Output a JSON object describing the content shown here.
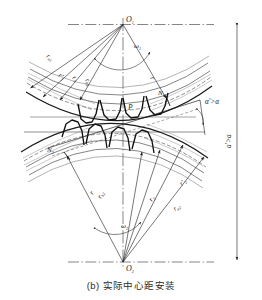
{
  "figure": {
    "caption_index": "(b)",
    "caption_text": "实际中心距安装",
    "caption_full": "(b) 实际中心距安装",
    "type": "engineering-diagram"
  },
  "centers": {
    "upper": "O",
    "upper_sub": "1",
    "lower": "O",
    "lower_sub": "2"
  },
  "angular_velocity": {
    "upper_symbol": "ω",
    "upper_sub": "1",
    "lower_symbol": "ω",
    "lower_sub": "2"
  },
  "radii_upper": [
    {
      "symbol": "r",
      "sub": "a1",
      "name": "addendum-radius-gear1"
    },
    {
      "symbol": "r′",
      "sub": "1",
      "name": "working-pitch-radius-gear1"
    },
    {
      "symbol": "r",
      "sub": "1",
      "name": "reference-pitch-radius-gear1"
    },
    {
      "symbol": "r",
      "sub": "b1",
      "name": "base-radius-gear1"
    }
  ],
  "radii_lower": [
    {
      "symbol": "r",
      "sub": "b2",
      "name": "base-radius-gear2"
    },
    {
      "symbol": "r",
      "sub": "2",
      "name": "reference-pitch-radius-gear2"
    },
    {
      "symbol": "r′",
      "sub": "2",
      "name": "working-pitch-radius-gear2"
    },
    {
      "symbol": "r",
      "sub": "a2",
      "name": "addendum-radius-gear2"
    }
  ],
  "points": {
    "pitch_point": "P",
    "contact_upper": "N",
    "contact_upper_sub": "1",
    "contact_lower": "N",
    "contact_lower_sub": "2"
  },
  "annotations": {
    "pressure_angle": "α′>α",
    "center_distance": "a′>a"
  },
  "colors": {
    "line": "#1a1a1a",
    "thin_line": "#555555",
    "background": "#ffffff",
    "text": "#1a1a1a"
  }
}
